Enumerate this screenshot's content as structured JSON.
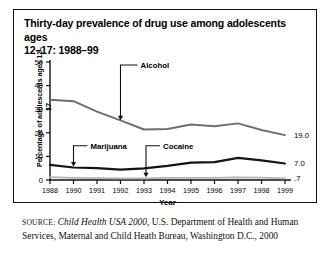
{
  "figure": {
    "title": "Thirty-day prevalence of drug use among adolescents ages 12–17: 1988–99",
    "title_line1": "Thirty-day prevalence of drug use among adolescents ages",
    "title_line2": "12–17: 1988–99",
    "source_label": "SOURCE:",
    "source_italic": "Child Health USA 2000",
    "source_rest": ", U.S. Department of Health and Human Services, Maternal and Child Heath Bureau, Washington D.C., 2000"
  },
  "chart_data": {
    "type": "line",
    "title": "Thirty-day prevalence of drug use among adolescents ages 12–17: 1988–99",
    "xlabel": "Year",
    "ylabel": "Percentage of adolescents ages 12–17",
    "x": [
      1988,
      1990,
      1991,
      1992,
      1993,
      1994,
      1995,
      1996,
      1997,
      1998,
      1999
    ],
    "xtick_labels": [
      "1988",
      "1990",
      "1991",
      "1992",
      "1993",
      "1994",
      "1995",
      "1996",
      "1997",
      "1998",
      "1999"
    ],
    "ytick_labels": [
      "0",
      "10",
      "20",
      "30",
      "40",
      "50"
    ],
    "yticks": [
      0,
      10,
      20,
      30,
      40,
      50
    ],
    "ylim": [
      0,
      50
    ],
    "grid": false,
    "legend": "none (direct labels with leader lines)",
    "series": [
      {
        "name": "Alcohol",
        "color": "#6e6e6e",
        "values": [
          34.0,
          33.4,
          29.0,
          25.3,
          21.4,
          21.6,
          23.5,
          22.8,
          24.0,
          21.2,
          19.0
        ],
        "end_label": "19.0"
      },
      {
        "name": "Marijuana",
        "color": "#141414",
        "values": [
          6.4,
          5.3,
          5.0,
          4.4,
          4.9,
          6.0,
          7.4,
          7.6,
          9.4,
          8.3,
          7.0
        ],
        "end_label": "7.0"
      },
      {
        "name": "Cocaine",
        "color": "#b4b4b4",
        "values": [
          1.2,
          0.9,
          0.8,
          0.7,
          0.7,
          0.9,
          0.9,
          0.9,
          1.1,
          1.0,
          0.7
        ],
        "end_label": ".7"
      }
    ],
    "annotations": [
      {
        "text": "Alcohol",
        "target_year": 1992,
        "target_value": 21.4
      },
      {
        "text": "Marijuana",
        "target_year": 1990,
        "target_value": 5.3
      },
      {
        "text": "Cocaine",
        "target_year": 1993,
        "target_value": 0.7
      }
    ]
  }
}
